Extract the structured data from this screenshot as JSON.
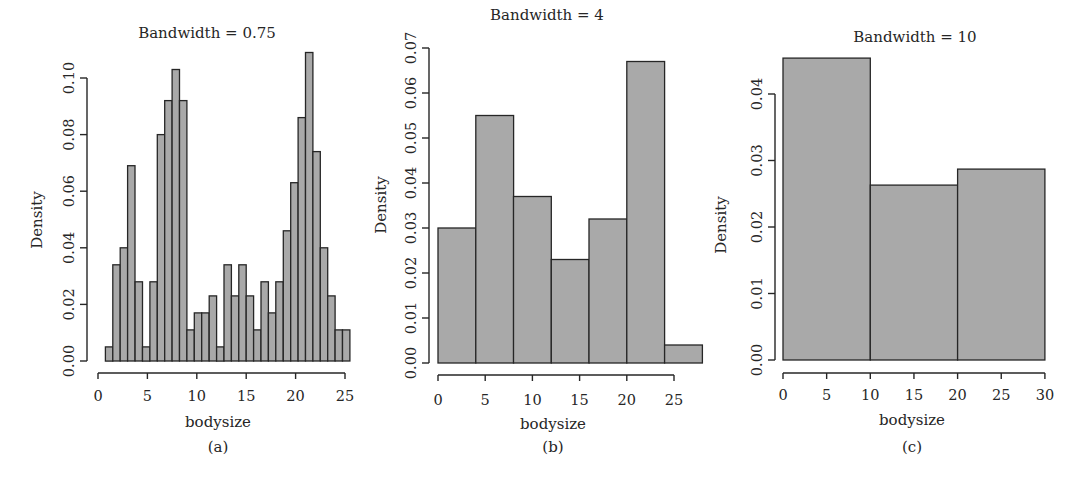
{
  "chart_data": [
    {
      "type": "bar",
      "panel": "(a)",
      "title": "Bandwidth = 0.75",
      "xlabel": "bodysize",
      "ylabel": "Density",
      "bin_width": 0.75,
      "bin_start": 0.75,
      "xlim": [
        0,
        25.5
      ],
      "ylim": [
        0,
        0.1
      ],
      "xticks": [
        0,
        5,
        10,
        15,
        20,
        25
      ],
      "yticks": [
        "0.00",
        "0.02",
        "0.04",
        "0.06",
        "0.08",
        "0.10"
      ],
      "values": [
        0.005,
        0.034,
        0.04,
        0.069,
        0.028,
        0.005,
        0.028,
        0.08,
        0.092,
        0.103,
        0.092,
        0.011,
        0.017,
        0.017,
        0.023,
        0.005,
        0.034,
        0.023,
        0.034,
        0.023,
        0.011,
        0.028,
        0.017,
        0.028,
        0.046,
        0.063,
        0.086,
        0.109,
        0.074,
        0.04,
        0.023,
        0.011,
        0.011
      ],
      "grid": false
    },
    {
      "type": "bar",
      "panel": "(b)",
      "title": "Bandwidth = 4",
      "xlabel": "bodysize",
      "ylabel": "Density",
      "bin_width": 4,
      "bin_start": 0,
      "xlim": [
        0,
        28
      ],
      "ylim": [
        0,
        0.07
      ],
      "xticks": [
        0,
        5,
        10,
        15,
        20,
        25
      ],
      "yticks": [
        "0.00",
        "0.01",
        "0.02",
        "0.03",
        "0.04",
        "0.05",
        "0.06",
        "0.07"
      ],
      "categories": [
        "0-4",
        "4-8",
        "8-12",
        "12-16",
        "16-20",
        "20-24",
        "24-28"
      ],
      "values": [
        0.03,
        0.055,
        0.037,
        0.023,
        0.032,
        0.067,
        0.004
      ],
      "grid": false
    },
    {
      "type": "bar",
      "panel": "(c)",
      "title": "Bandwidth = 10",
      "xlabel": "bodysize",
      "ylabel": "Density",
      "bin_width": 10,
      "bin_start": 0,
      "xlim": [
        0,
        30
      ],
      "ylim": [
        0,
        0.04
      ],
      "xticks": [
        0,
        5,
        10,
        15,
        20,
        25,
        30
      ],
      "yticks": [
        "0.00",
        "0.01",
        "0.02",
        "0.03",
        "0.04"
      ],
      "categories": [
        "0-10",
        "10-20",
        "20-30"
      ],
      "values": [
        0.0454,
        0.0263,
        0.0287
      ],
      "grid": false
    }
  ],
  "colors": {
    "bar_fill": "#a9a9a9",
    "bar_stroke": "#262626",
    "axis": "#262626"
  }
}
